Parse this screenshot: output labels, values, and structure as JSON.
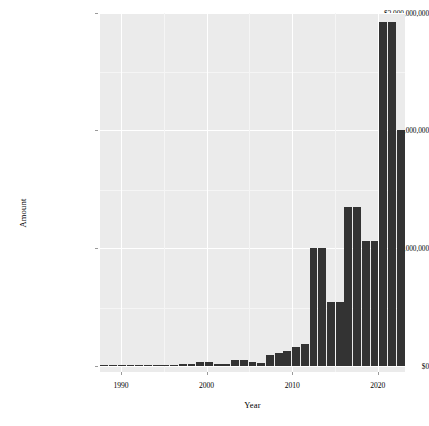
{
  "chart_data": {
    "type": "bar",
    "title": "",
    "subtitle": "",
    "xlabel": "Year",
    "ylabel": "Amount",
    "x_tick_labels": [
      "1990",
      "2000",
      "2010",
      "2020"
    ],
    "x_tick_values": [
      1990,
      2000,
      2010,
      2020
    ],
    "y_tick_labels": [
      "$0",
      "$1,000,000,000",
      "$2,000,000,000",
      "$3,000,000,000"
    ],
    "y_tick_values": [
      0,
      1000000000,
      2000000000,
      3000000000
    ],
    "xlim": [
      1988.5,
      2023.5
    ],
    "ylim": [
      0,
      3000000000
    ],
    "grid": true,
    "legend": null,
    "bar_color": "#333333",
    "panel_background": "#ebebeb",
    "gridline_color": "#ffffff",
    "categories": [
      1989,
      1990,
      1991,
      1992,
      1993,
      1994,
      1995,
      1996,
      1997,
      1998,
      1999,
      2000,
      2001,
      2002,
      2003,
      2004,
      2005,
      2006,
      2007,
      2008,
      2009,
      2010,
      2011,
      2012,
      2013,
      2014,
      2015,
      2016,
      2017,
      2018,
      2019,
      2020,
      2021,
      2022,
      2023
    ],
    "values": [
      5000000,
      6000000,
      7000000,
      9000000,
      8000000,
      7000000,
      10000000,
      12000000,
      11000000,
      13000000,
      15000000,
      35000000,
      30000000,
      18000000,
      20000000,
      55000000,
      50000000,
      30000000,
      28000000,
      95000000,
      110000000,
      130000000,
      160000000,
      185000000,
      1000000000,
      1000000000,
      545000000,
      545000000,
      1355000000,
      1355000000,
      1060000000,
      1060000000,
      2925000000,
      2925000000,
      2010000000
    ]
  },
  "axes": {
    "y_title": "Amount",
    "x_title": "Year"
  }
}
